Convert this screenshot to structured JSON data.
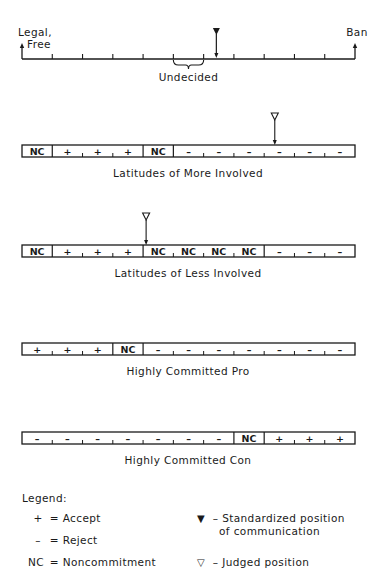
{
  "scale": {
    "left_label_line1": "Legal,",
    "left_label_line2": "Free",
    "right_label": "Ban",
    "undecided_label": "Undecided",
    "tick_count": 10,
    "standardized_position_index": 6.42
  },
  "bars": [
    {
      "id": "more-involved",
      "title": "Latitudes of More Involved",
      "cells": [
        "NC",
        "+",
        "+",
        "+",
        "NC",
        "–",
        "–",
        "–",
        "–",
        "–",
        "–"
      ],
      "judged_position_cell": 8
    },
    {
      "id": "less-involved",
      "title": "Latitudes of Less Involved",
      "cells": [
        "NC",
        "+",
        "+",
        "+",
        "NC",
        "NC",
        "NC",
        "NC",
        "–",
        "–",
        "–"
      ],
      "judged_position_cell": 4
    },
    {
      "id": "committed-pro",
      "title": "Highly Committed Pro",
      "cells": [
        "+",
        "+",
        "+",
        "NC",
        "–",
        "–",
        "–",
        "–",
        "–",
        "–",
        "–"
      ],
      "judged_position_cell": null
    },
    {
      "id": "committed-con",
      "title": "Highly Committed Con",
      "cells": [
        "–",
        "–",
        "–",
        "–",
        "–",
        "–",
        "–",
        "NC",
        "+",
        "+",
        "+"
      ],
      "judged_position_cell": null
    }
  ],
  "legend": {
    "title": "Legend:",
    "items": [
      {
        "symbol": "+",
        "text": "= Accept"
      },
      {
        "symbol": "–",
        "text": "= Reject"
      },
      {
        "symbol": "NC",
        "text": "= Noncommitment"
      }
    ],
    "markers": [
      {
        "symbol": "▼",
        "text_line1": "– Standardized position",
        "text_line2": "of communication"
      },
      {
        "symbol": "▽",
        "text_line1": "– Judged position",
        "text_line2": ""
      }
    ]
  }
}
